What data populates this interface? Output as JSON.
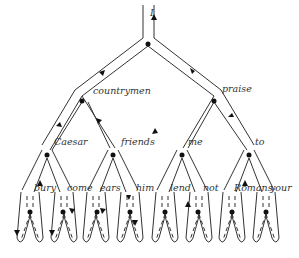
{
  "diagram": {
    "root_label": "I",
    "level1": [
      {
        "label": "countrymen"
      },
      {
        "label": "praise"
      }
    ],
    "level2": [
      {
        "label": "Caesar"
      },
      {
        "label": "friends"
      },
      {
        "label": "me"
      },
      {
        "label": "to"
      }
    ],
    "level3": [
      {
        "label": "bury"
      },
      {
        "label": "come"
      },
      {
        "label": "ears"
      },
      {
        "label": "him"
      },
      {
        "label": "lend"
      },
      {
        "label": "not"
      },
      {
        "label": "Romans"
      },
      {
        "label": "your"
      }
    ],
    "colors": {
      "line": "#333333",
      "background": "#ffffff"
    }
  }
}
